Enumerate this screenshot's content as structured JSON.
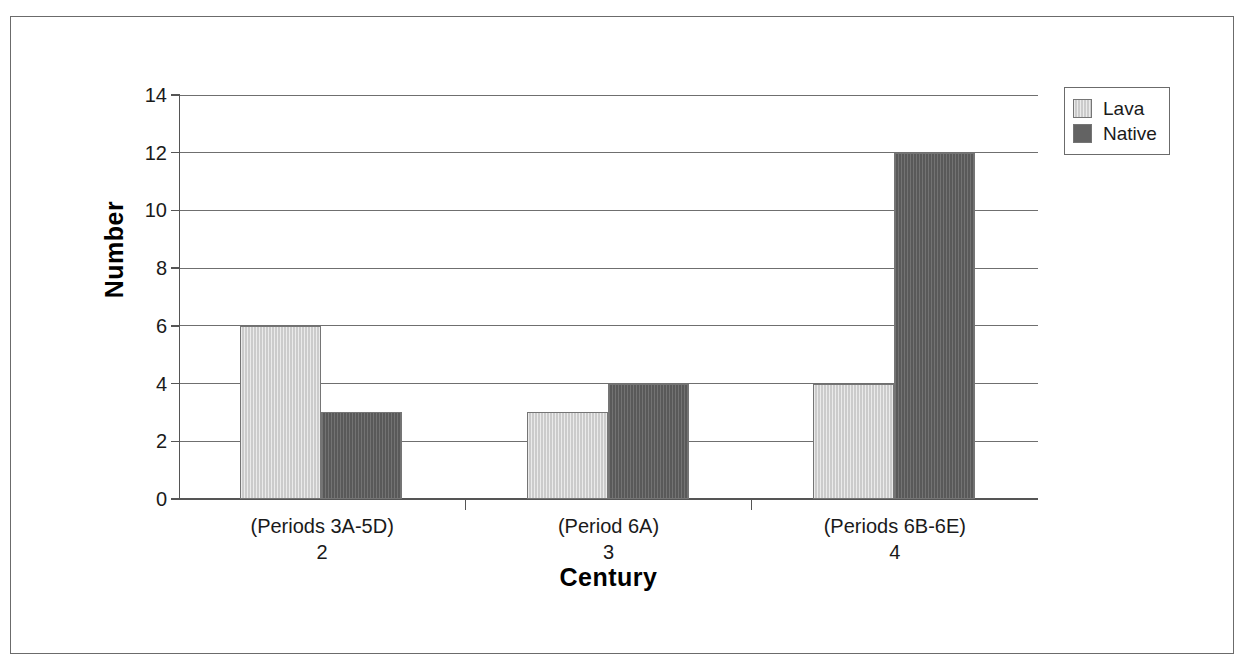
{
  "chart_data": {
    "type": "bar",
    "title": "",
    "subtitle": "",
    "xlabel": "Century",
    "ylabel": "Number",
    "categories": [
      "(Periods 3A-5D)",
      "(Period 6A)",
      "(Periods 6B-6E)"
    ],
    "category_numbers": [
      "2",
      "3",
      "4"
    ],
    "series": [
      {
        "name": "Lava",
        "values": [
          6,
          3,
          4
        ],
        "color": "#d2d2d2"
      },
      {
        "name": "Native",
        "values": [
          3,
          4,
          12
        ],
        "color": "#636363"
      }
    ],
    "ylim": [
      0,
      14
    ],
    "ytick_step": 2,
    "yticks": [
      "0",
      "2",
      "4",
      "6",
      "8",
      "10",
      "12",
      "14"
    ],
    "grid": true,
    "grid_axis": "y",
    "legend_position": "top-right",
    "bar_border_color": "#757575",
    "axis_color": "#555555",
    "grid_color": "#6f6f6f",
    "frame_color": "#6b6b6b",
    "background": "#ffffff"
  },
  "legend": {
    "entries": [
      {
        "label": "Lava"
      },
      {
        "label": "Native"
      }
    ]
  },
  "axes": {
    "y_title": "Number",
    "x_title": "Century"
  }
}
